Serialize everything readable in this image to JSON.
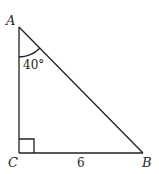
{
  "diagram": {
    "type": "right-triangle",
    "vertices": {
      "A": {
        "label": "A"
      },
      "B": {
        "label": "B"
      },
      "C": {
        "label": "C"
      }
    },
    "angle_A": {
      "label": "40°"
    },
    "side_CB": {
      "label": "6"
    },
    "right_angle_at": "C",
    "stroke_color": "#231f20"
  }
}
